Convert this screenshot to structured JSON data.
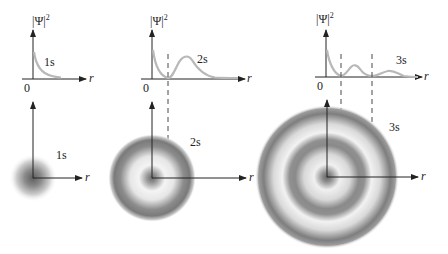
{
  "diagram": {
    "y_axis_label": "|Ψ|",
    "y_axis_exponent": "2",
    "x_axis_label": "r",
    "origin_label": "0",
    "panels": [
      {
        "id": "1s",
        "label": "1s",
        "nodes": 0,
        "curve_label": "1s",
        "cloud_label": "1s"
      },
      {
        "id": "2s",
        "label": "2s",
        "nodes": 1,
        "curve_label": "2s",
        "cloud_label": "2s"
      },
      {
        "id": "3s",
        "label": "3s",
        "nodes": 2,
        "curve_label": "3s",
        "cloud_label": "3s"
      }
    ],
    "colors": {
      "curve": "#b8b8b8",
      "axis": "#222222",
      "cloud_dark": "#6a6a6a",
      "background": "#ffffff"
    }
  }
}
